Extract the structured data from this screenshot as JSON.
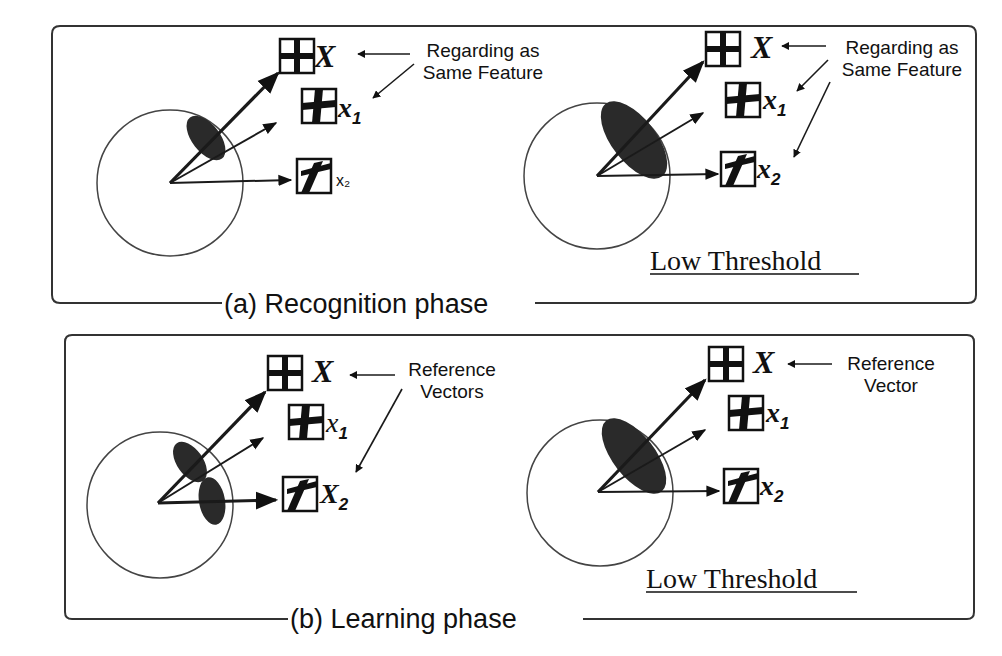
{
  "figure": {
    "panels": [
      {
        "id": "recognition",
        "caption": "(a) Recognition phase",
        "left": {
          "reference_label": "X",
          "inputs": [
            {
              "label": "x",
              "sub": "1"
            },
            {
              "label": "",
              "sub": ""
            }
          ],
          "annotation": [
            "Regarding as",
            "Same Feature"
          ],
          "regions": 1
        },
        "right": {
          "reference_label": "X",
          "inputs": [
            {
              "label": "x",
              "sub": "1"
            },
            {
              "label": "x",
              "sub": "2"
            }
          ],
          "annotation": [
            "Regarding as",
            "Same Feature"
          ],
          "threshold_label": "Low Threshold",
          "regions": 1
        }
      },
      {
        "id": "learning",
        "caption": "(b) Learning phase",
        "left": {
          "reference_label": "X",
          "inputs": [
            {
              "label": "x",
              "sub": "1"
            },
            {
              "label": "X",
              "sub": "2"
            }
          ],
          "annotation": [
            "Reference",
            "Vectors"
          ],
          "regions": 2
        },
        "right": {
          "reference_label": "X",
          "inputs": [
            {
              "label": "x",
              "sub": "1"
            },
            {
              "label": "x",
              "sub": "2"
            }
          ],
          "annotation": [
            "Reference",
            "Vector"
          ],
          "threshold_label": "Low Threshold",
          "regions": 1
        }
      }
    ],
    "icons": {
      "reference_pattern": "cross-grid-pattern-icon",
      "input_pattern_1": "slanted-cross-pattern-icon",
      "input_pattern_2": "seven-stroke-pattern-icon"
    }
  }
}
